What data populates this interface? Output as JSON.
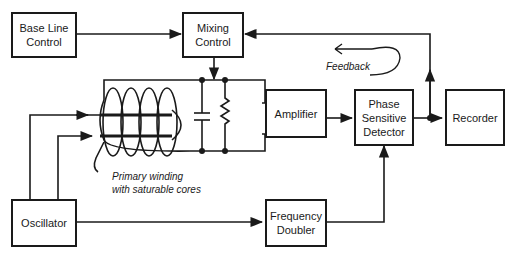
{
  "blocks": {
    "base_line_control": "Base Line\nControl",
    "mixing_control": "Mixing\nControl",
    "amplifier": "Amplifier",
    "phase_sensitive_detector": "Phase\nSensitive\nDetector",
    "recorder": "Recorder",
    "oscillator": "Oscillator",
    "frequency_doubler": "Frequency\nDoubler"
  },
  "annotations": {
    "feedback": "Feedback",
    "primary_winding": "Primary winding\nwith saturable cores"
  },
  "colors": {
    "line": "#1a1a1a",
    "background": "#ffffff"
  }
}
